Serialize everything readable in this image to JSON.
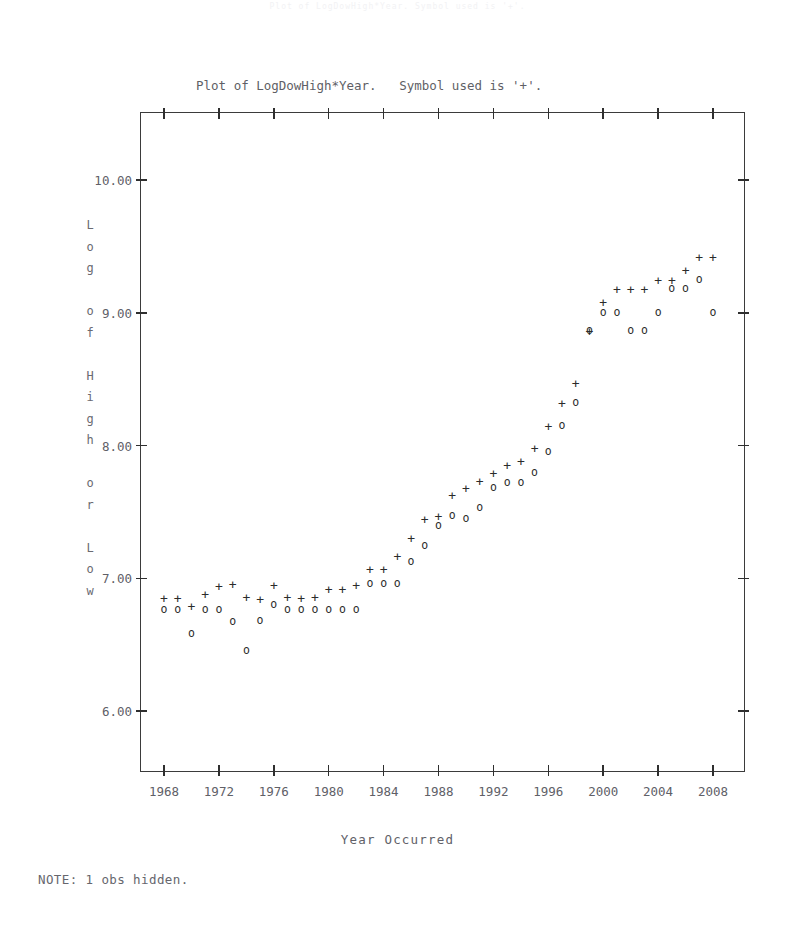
{
  "page": {
    "ghost_header": "Plot of LogDowHigh*Year.   Symbol used is '+'.",
    "ghost_footer": "",
    "note": "NOTE: 1 obs hidden."
  },
  "titles": {
    "line1": "Plot of LogDowHigh*Year.   Symbol used is '+'.",
    "line2": "Plot of LogDowLow*Year.    Symbol used is 'o'."
  },
  "axes": {
    "x_title": "Year Occurred",
    "y_title_chars": [
      "L",
      "o",
      "g",
      "",
      "o",
      "f",
      "",
      "H",
      "i",
      "g",
      "h",
      "",
      "o",
      "r",
      "",
      "L",
      "o",
      "w"
    ],
    "y_ticks": [
      "10.00",
      "9.00",
      "8.00",
      "7.00",
      "6.00"
    ],
    "x_ticks": [
      "1968",
      "1972",
      "1976",
      "1980",
      "1984",
      "1988",
      "1992",
      "1996",
      "2000",
      "2004",
      "2008"
    ]
  },
  "chart_data": {
    "type": "scatter",
    "title": "Plot of LogDowHigh*Year.   Symbol used is '+'.",
    "subtitle": "Plot of LogDowLow*Year.    Symbol used is 'o'.",
    "xlabel": "Year Occurred",
    "ylabel": "Log of High or Low",
    "xlim": [
      1966,
      2010
    ],
    "ylim": [
      5.7,
      10.45
    ],
    "grid": false,
    "legend": "inline-title",
    "note": "NOTE: 1 obs hidden.",
    "series": [
      {
        "name": "LogDowHigh",
        "symbol": "+",
        "x": [
          1968,
          1969,
          1970,
          1971,
          1972,
          1973,
          1974,
          1975,
          1976,
          1977,
          1978,
          1979,
          1980,
          1981,
          1982,
          1983,
          1984,
          1985,
          1986,
          1987,
          1988,
          1989,
          1990,
          1991,
          1992,
          1993,
          1994,
          1995,
          1996,
          1997,
          1998,
          1999,
          2000,
          2001,
          2002,
          2003,
          2004,
          2005,
          2006,
          2007,
          2008
        ],
        "y": [
          6.85,
          6.85,
          6.79,
          6.88,
          6.94,
          6.96,
          6.86,
          6.84,
          6.95,
          6.86,
          6.85,
          6.86,
          6.92,
          6.92,
          6.95,
          7.07,
          7.07,
          7.17,
          7.3,
          7.45,
          7.47,
          7.63,
          7.68,
          7.73,
          7.79,
          7.85,
          7.88,
          7.98,
          8.15,
          8.32,
          8.47,
          8.86,
          9.08,
          9.18,
          9.18,
          9.18,
          9.25,
          9.25,
          9.32,
          9.42,
          9.42
        ]
      },
      {
        "name": "LogDowLow",
        "symbol": "o",
        "x": [
          1968,
          1969,
          1970,
          1971,
          1972,
          1973,
          1974,
          1975,
          1976,
          1977,
          1978,
          1979,
          1980,
          1981,
          1982,
          1983,
          1984,
          1985,
          1986,
          1987,
          1988,
          1989,
          1990,
          1991,
          1992,
          1993,
          1994,
          1995,
          1996,
          1997,
          1998,
          1999,
          2000,
          2001,
          2002,
          2003,
          2004,
          2005,
          2006,
          2007,
          2008
        ],
        "y": [
          6.76,
          6.76,
          6.58,
          6.76,
          6.76,
          6.67,
          6.45,
          6.68,
          6.8,
          6.76,
          6.76,
          6.76,
          6.76,
          6.76,
          6.76,
          6.96,
          6.96,
          6.96,
          7.12,
          7.24,
          7.39,
          7.47,
          7.45,
          7.53,
          7.68,
          7.72,
          7.72,
          7.79,
          7.95,
          8.15,
          8.32,
          8.86,
          9.0,
          9.0,
          8.86,
          8.86,
          9.0,
          9.18,
          9.18,
          9.25,
          9.0
        ]
      }
    ]
  },
  "points_high": [
    {
      "x": 162,
      "y": 615
    },
    {
      "x": 190,
      "y": 615
    },
    {
      "x": 218,
      "y": 596
    },
    {
      "x": 246,
      "y": 596
    },
    {
      "x": 246,
      "y": 615
    },
    {
      "x": 274,
      "y": 615
    },
    {
      "x": 302,
      "y": 596
    },
    {
      "x": 302,
      "y": 615
    },
    {
      "x": 330,
      "y": 615
    },
    {
      "x": 344,
      "y": 615
    },
    {
      "x": 358,
      "y": 596
    },
    {
      "x": 372,
      "y": 596
    },
    {
      "x": 386,
      "y": 615
    },
    {
      "x": 400,
      "y": 615
    },
    {
      "x": 414,
      "y": 596
    },
    {
      "x": 345,
      "y": 596
    },
    {
      "x": 360,
      "y": 596
    },
    {
      "x": 400,
      "y": 575
    },
    {
      "x": 414,
      "y": 575
    },
    {
      "x": 428,
      "y": 547
    },
    {
      "x": 442,
      "y": 530
    },
    {
      "x": 456,
      "y": 506
    },
    {
      "x": 470,
      "y": 479
    },
    {
      "x": 484,
      "y": 479
    },
    {
      "x": 498,
      "y": 452
    },
    {
      "x": 512,
      "y": 436
    },
    {
      "x": 526,
      "y": 407
    },
    {
      "x": 540,
      "y": 390
    },
    {
      "x": 554,
      "y": 362
    },
    {
      "x": 572,
      "y": 342
    },
    {
      "x": 586,
      "y": 318
    },
    {
      "x": 600,
      "y": 294
    },
    {
      "x": 614,
      "y": 270
    },
    {
      "x": 628,
      "y": 270
    },
    {
      "x": 642,
      "y": 270
    },
    {
      "x": 656,
      "y": 270
    },
    {
      "x": 670,
      "y": 270
    },
    {
      "x": 684,
      "y": 246
    },
    {
      "x": 698,
      "y": 246
    },
    {
      "x": 712,
      "y": 246
    }
  ],
  "points_low": [
    {
      "x": 162,
      "y": 636
    },
    {
      "x": 190,
      "y": 636
    },
    {
      "x": 204,
      "y": 660
    },
    {
      "x": 218,
      "y": 636
    },
    {
      "x": 246,
      "y": 636
    },
    {
      "x": 260,
      "y": 660
    },
    {
      "x": 246,
      "y": 684
    },
    {
      "x": 274,
      "y": 636
    },
    {
      "x": 302,
      "y": 636
    },
    {
      "x": 330,
      "y": 636
    },
    {
      "x": 344,
      "y": 636
    },
    {
      "x": 372,
      "y": 636
    },
    {
      "x": 386,
      "y": 636
    },
    {
      "x": 414,
      "y": 636
    },
    {
      "x": 428,
      "y": 636
    },
    {
      "x": 456,
      "y": 615
    },
    {
      "x": 470,
      "y": 615
    },
    {
      "x": 484,
      "y": 615
    },
    {
      "x": 498,
      "y": 596
    },
    {
      "x": 512,
      "y": 575
    },
    {
      "x": 526,
      "y": 547
    },
    {
      "x": 540,
      "y": 530
    },
    {
      "x": 554,
      "y": 530
    },
    {
      "x": 568,
      "y": 506
    },
    {
      "x": 582,
      "y": 479
    },
    {
      "x": 596,
      "y": 452
    },
    {
      "x": 610,
      "y": 407
    },
    {
      "x": 624,
      "y": 342
    },
    {
      "x": 638,
      "y": 318
    },
    {
      "x": 652,
      "y": 318
    },
    {
      "x": 666,
      "y": 342
    },
    {
      "x": 680,
      "y": 342
    },
    {
      "x": 694,
      "y": 294
    },
    {
      "x": 708,
      "y": 294
    },
    {
      "x": 722,
      "y": 318
    }
  ]
}
